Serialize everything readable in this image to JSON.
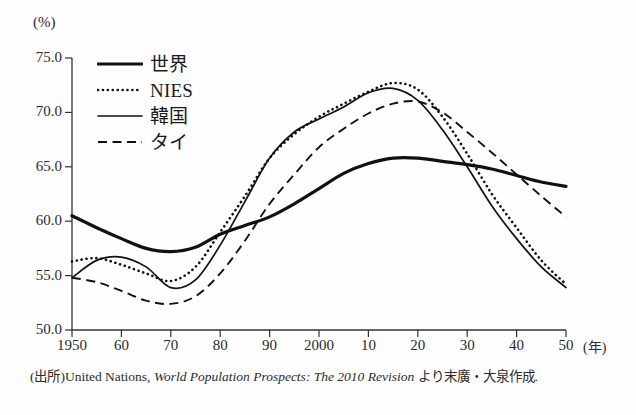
{
  "figure": {
    "yaxis_unit": "(%)",
    "xaxis_unit": "(年)",
    "source_prefix": "(出所)",
    "source_main": "United Nations, ",
    "source_italic": "World Population Prospects: The 2010 Revision",
    "source_suffix": " より末廣・大泉作成."
  },
  "chart_data": {
    "type": "line",
    "title": "",
    "xlabel": "(年)",
    "ylabel": "(%)",
    "xlim": [
      1950,
      2050
    ],
    "ylim": [
      50.0,
      75.0
    ],
    "grid": false,
    "legend_position": "top-left",
    "xticks": [
      1950,
      1960,
      1970,
      1980,
      1990,
      2000,
      2010,
      2020,
      2030,
      2040,
      2050
    ],
    "xtick_labels": [
      "1950",
      "60",
      "70",
      "80",
      "90",
      "2000",
      "10",
      "20",
      "30",
      "40",
      "50"
    ],
    "yticks": [
      50.0,
      55.0,
      60.0,
      65.0,
      70.0,
      75.0
    ],
    "ytick_labels": [
      "50.0",
      "55.0",
      "60.0",
      "65.0",
      "70.0",
      "75.0"
    ],
    "x": [
      1950,
      1955,
      1960,
      1965,
      1970,
      1975,
      1980,
      1985,
      1990,
      1995,
      2000,
      2005,
      2010,
      2015,
      2020,
      2025,
      2030,
      2035,
      2040,
      2045,
      2050
    ],
    "series": [
      {
        "name": "世界",
        "style": "solid-thick",
        "line_width": 3.2,
        "color": "#111111",
        "values": [
          60.5,
          59.4,
          58.4,
          57.5,
          57.2,
          57.6,
          58.8,
          59.6,
          60.4,
          61.6,
          63.0,
          64.4,
          65.3,
          65.8,
          65.8,
          65.5,
          65.2,
          64.8,
          64.2,
          63.6,
          63.2
        ]
      },
      {
        "name": "NIES",
        "style": "dotted",
        "line_width": 2.6,
        "color": "#111111",
        "values": [
          56.3,
          56.6,
          56.0,
          55.2,
          54.5,
          55.8,
          59.0,
          62.3,
          65.8,
          68.0,
          69.6,
          70.8,
          71.9,
          72.7,
          72.1,
          69.6,
          66.2,
          62.5,
          59.4,
          56.4,
          54.2
        ]
      },
      {
        "name": "韓国",
        "style": "solid-thin",
        "line_width": 1.7,
        "color": "#111111",
        "values": [
          54.8,
          56.4,
          56.7,
          55.8,
          53.9,
          54.6,
          57.8,
          61.8,
          65.8,
          68.2,
          69.4,
          70.5,
          71.8,
          72.2,
          71.1,
          68.4,
          65.0,
          61.4,
          58.4,
          55.8,
          53.9
        ]
      },
      {
        "name": "タイ",
        "style": "dashed",
        "line_width": 1.9,
        "color": "#111111",
        "values": [
          54.8,
          54.4,
          53.6,
          52.7,
          52.4,
          53.1,
          55.2,
          58.2,
          61.6,
          64.3,
          66.8,
          68.5,
          69.9,
          70.8,
          71.0,
          70.0,
          68.2,
          66.3,
          64.3,
          62.3,
          60.4
        ]
      }
    ]
  },
  "legend": {
    "items": [
      {
        "label": "世界",
        "style": "solid-thick"
      },
      {
        "label": "NIES",
        "style": "dotted"
      },
      {
        "label": "韓国",
        "style": "solid-thin"
      },
      {
        "label": "タイ",
        "style": "dashed"
      }
    ]
  }
}
